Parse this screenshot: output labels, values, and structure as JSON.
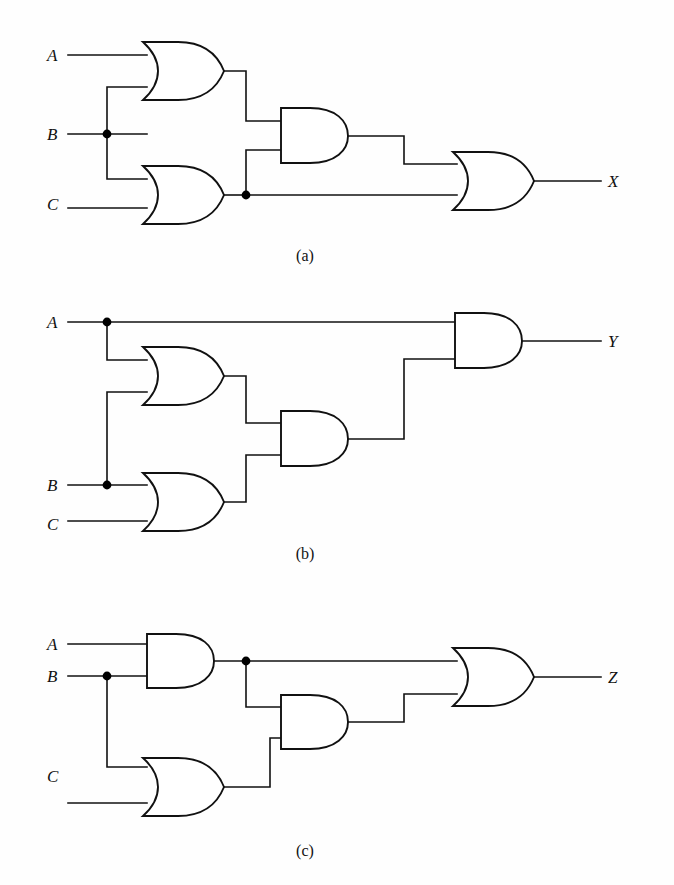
{
  "figure": {
    "background_color": "#fefefe",
    "line_color": "#111111",
    "panel_count": 3
  },
  "panels": [
    {
      "id": "a",
      "caption": "(a)",
      "output_label": "X",
      "inputs": [
        {
          "label": "A",
          "name": "input-a"
        },
        {
          "label": "B",
          "name": "input-b"
        },
        {
          "label": "C",
          "name": "input-c"
        }
      ],
      "gates": [
        {
          "id": "a-or-top",
          "type": "OR",
          "inputs": [
            "A",
            "B"
          ]
        },
        {
          "id": "a-or-bottom",
          "type": "OR",
          "inputs": [
            "B",
            "C"
          ]
        },
        {
          "id": "a-and-mid",
          "type": "AND",
          "inputs": [
            "a-or-top",
            "a-or-bottom"
          ]
        },
        {
          "id": "a-or-out",
          "type": "OR",
          "inputs": [
            "a-and-mid",
            "a-or-bottom"
          ]
        }
      ],
      "junctions": [
        "B-fanout",
        "a-or-bottom-fanout"
      ],
      "expression": "X = ((A + B)(B + C)) + (B + C)"
    },
    {
      "id": "b",
      "caption": "(b)",
      "output_label": "Y",
      "inputs": [
        {
          "label": "A",
          "name": "input-a"
        },
        {
          "label": "B",
          "name": "input-b"
        },
        {
          "label": "C",
          "name": "input-c"
        }
      ],
      "gates": [
        {
          "id": "b-or-top",
          "type": "OR",
          "inputs": [
            "A",
            "B"
          ]
        },
        {
          "id": "b-or-bottom",
          "type": "OR",
          "inputs": [
            "B",
            "C"
          ]
        },
        {
          "id": "b-and-mid",
          "type": "AND",
          "inputs": [
            "b-or-top",
            "b-or-bottom"
          ]
        },
        {
          "id": "b-and-out",
          "type": "AND",
          "inputs": [
            "A",
            "b-and-mid"
          ]
        }
      ],
      "junctions": [
        "A-fanout",
        "B-fanout"
      ],
      "expression": "Y = A((A + B)(B + C))"
    },
    {
      "id": "c",
      "caption": "(c)",
      "output_label": "Z",
      "inputs": [
        {
          "label": "A",
          "name": "input-a"
        },
        {
          "label": "B",
          "name": "input-b"
        },
        {
          "label": "C",
          "name": "input-c"
        }
      ],
      "gates": [
        {
          "id": "c-and-top",
          "type": "AND",
          "inputs": [
            "A",
            "B"
          ]
        },
        {
          "id": "c-or-bottom",
          "type": "OR",
          "inputs": [
            "B",
            "C"
          ]
        },
        {
          "id": "c-and-mid",
          "type": "AND",
          "inputs": [
            "c-and-top",
            "c-or-bottom"
          ]
        },
        {
          "id": "c-or-out",
          "type": "OR",
          "inputs": [
            "c-and-top",
            "c-and-mid"
          ]
        }
      ],
      "junctions": [
        "B-fanout",
        "c-and-top-fanout"
      ],
      "expression": "Z = (AB) + ((AB)(B + C))"
    }
  ]
}
